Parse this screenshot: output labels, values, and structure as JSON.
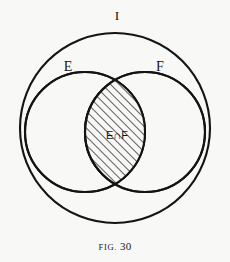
{
  "figure": {
    "caption_word": "Fig.",
    "caption_number": "30",
    "background_color": "#f8f8f7",
    "ink_color": "#141414"
  },
  "diagram": {
    "type": "venn-diagram",
    "universe": {
      "label": "I",
      "cx": 115,
      "cy": 128,
      "r": 95,
      "label_x": 117,
      "label_y": 17
    },
    "sets": [
      {
        "label": "E",
        "cx": 85,
        "cy": 132,
        "r": 60,
        "label_x": 68,
        "label_y": 68
      },
      {
        "label": "F",
        "cx": 145,
        "cy": 132,
        "r": 60,
        "label_x": 160,
        "label_y": 68
      }
    ],
    "intersection": {
      "label": "E∩F",
      "label_x": 117,
      "label_y": 136,
      "fill": "hatched-diagonal",
      "hatch_direction": "forward-slash",
      "top_crossing_x": 118,
      "top_crossing_y": 88,
      "bottom_crossing_x": 118,
      "bottom_crossing_y": 180
    }
  }
}
